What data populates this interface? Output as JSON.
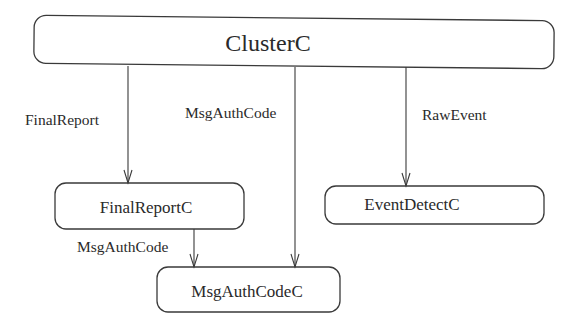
{
  "diagram": {
    "type": "component-wiring",
    "nodes": [
      {
        "id": "ClusterC",
        "label": "ClusterC",
        "x": 34,
        "y": 18,
        "w": 520,
        "h": 48,
        "cx": 268,
        "cy": 43
      },
      {
        "id": "FinalReportC",
        "label": "FinalReportC",
        "x": 55,
        "y": 183,
        "w": 189,
        "h": 46,
        "cx": 146,
        "cy": 207
      },
      {
        "id": "EventDetectC",
        "label": "EventDetectC",
        "x": 325,
        "y": 186,
        "w": 219,
        "h": 38,
        "cx": 418,
        "cy": 205
      },
      {
        "id": "MsgAuthCodeC",
        "label": "MsgAuthCodeC",
        "x": 157,
        "y": 267,
        "w": 183,
        "h": 45,
        "cx": 247,
        "cy": 290
      }
    ],
    "edges": [
      {
        "from": "ClusterC",
        "to": "FinalReportC",
        "label": "FinalReport",
        "x": 128,
        "y1": 66,
        "y2": 183,
        "label_x": 25,
        "label_y": 125
      },
      {
        "from": "ClusterC",
        "to": "MsgAuthCodeC",
        "label": "MsgAuthCode",
        "x": 295,
        "y1": 66,
        "y2": 267,
        "label_x": 185,
        "label_y": 113
      },
      {
        "from": "ClusterC",
        "to": "EventDetectC",
        "label": "RawEvent",
        "x": 406,
        "y1": 66,
        "y2": 186,
        "label_x": 422,
        "label_y": 115
      },
      {
        "from": "FinalReportC",
        "to": "MsgAuthCodeC",
        "label": "MsgAuthCode",
        "x": 194,
        "y1": 229,
        "y2": 267,
        "label_x": 77,
        "label_y": 247
      }
    ]
  }
}
